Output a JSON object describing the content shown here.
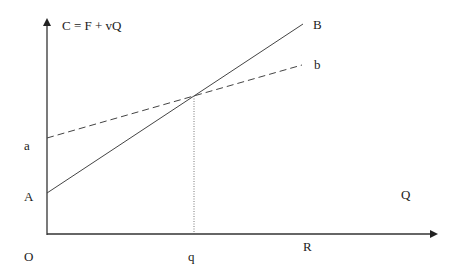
{
  "diagram": {
    "title_equation": "C = F + vQ",
    "axes": {
      "origin_label": "O",
      "x_axis_label": "Q",
      "x_point_label_q": "q",
      "x_point_label_R": "R"
    },
    "lines": [
      {
        "name": "A-B",
        "start_label": "A",
        "end_label": "B",
        "style": "solid"
      },
      {
        "name": "a-b",
        "start_label": "a",
        "end_label": "b",
        "style": "dashed"
      }
    ],
    "intersection_dropline": {
      "style": "dotted",
      "to_label": "q"
    }
  },
  "colors": {
    "line": "#444444",
    "text": "#222222",
    "background": "#ffffff"
  }
}
